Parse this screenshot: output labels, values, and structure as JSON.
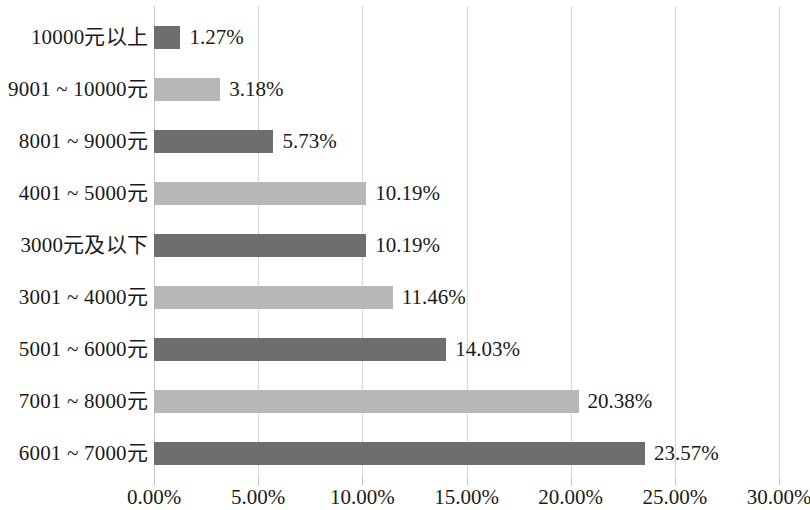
{
  "chart_data": {
    "type": "bar",
    "orientation": "horizontal",
    "title": "",
    "subtitle": "",
    "xlabel": "",
    "ylabel": "",
    "xlim": [
      0,
      30
    ],
    "xtick_labels": [
      "0.00%",
      "5.00%",
      "10.00%",
      "15.00%",
      "20.00%",
      "25.00%",
      "30.00%"
    ],
    "xticks": [
      0,
      5,
      10,
      15,
      20,
      25,
      30
    ],
    "grid": "vertical",
    "legend": "none",
    "value_suffix": "%",
    "categories": [
      "10000元以上",
      "9001 ~ 10000元",
      "8001 ~ 9000元",
      "4001 ~ 5000元",
      "3000元及以下",
      "3001 ~ 4000元",
      "5001 ~ 6000元",
      "7001 ~ 8000元",
      "6001 ~ 7000元"
    ],
    "values": [
      1.27,
      3.18,
      5.73,
      10.19,
      10.19,
      11.46,
      14.03,
      20.38,
      23.57
    ],
    "value_labels": [
      "1.27%",
      "3.18%",
      "5.73%",
      "10.19%",
      "10.19%",
      "11.46%",
      "14.03%",
      "20.38%",
      "23.57%"
    ],
    "bar_colors": [
      "dark",
      "light",
      "dark",
      "light",
      "dark",
      "light",
      "dark",
      "light",
      "dark"
    ],
    "colors": {
      "bar_dark": "#6e6e6e",
      "bar_light": "#b7b7b7",
      "gridline": "#d9d9d9",
      "text": "#1a1a1a",
      "background": "#ffffff"
    }
  },
  "rows": [
    {
      "label": "10000元以上",
      "value_label": "1.27%",
      "value": 1.27,
      "tone": "dark"
    },
    {
      "label": "9001 ~ 10000元",
      "value_label": "3.18%",
      "value": 3.18,
      "tone": "light"
    },
    {
      "label": "8001 ~ 9000元",
      "value_label": "5.73%",
      "value": 5.73,
      "tone": "dark"
    },
    {
      "label": "4001 ~ 5000元",
      "value_label": "10.19%",
      "value": 10.19,
      "tone": "light"
    },
    {
      "label": "3000元及以下",
      "value_label": "10.19%",
      "value": 10.19,
      "tone": "dark"
    },
    {
      "label": "3001 ~ 4000元",
      "value_label": "11.46%",
      "value": 11.46,
      "tone": "light"
    },
    {
      "label": "5001 ~ 6000元",
      "value_label": "14.03%",
      "value": 14.03,
      "tone": "dark"
    },
    {
      "label": "7001 ~ 8000元",
      "value_label": "20.38%",
      "value": 20.38,
      "tone": "light"
    },
    {
      "label": "6001 ~ 7000元",
      "value_label": "23.57%",
      "value": 23.57,
      "tone": "dark"
    }
  ],
  "axis": {
    "ticks": [
      {
        "label": "0.00%",
        "value": 0
      },
      {
        "label": "5.00%",
        "value": 5
      },
      {
        "label": "10.00%",
        "value": 10
      },
      {
        "label": "15.00%",
        "value": 15
      },
      {
        "label": "20.00%",
        "value": 20
      },
      {
        "label": "25.00%",
        "value": 25
      },
      {
        "label": "30.00%",
        "value": 30
      }
    ]
  }
}
